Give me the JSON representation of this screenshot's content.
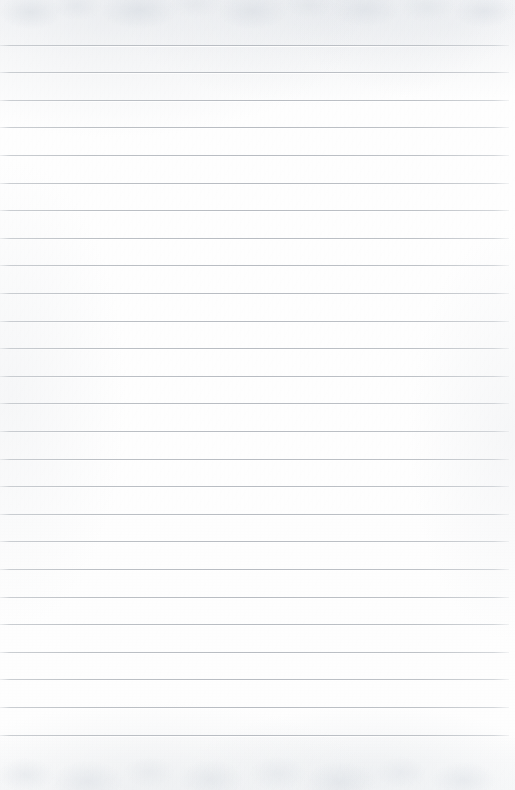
{
  "document": {
    "kind": "lined-notebook-paper-scan",
    "title": "Blank ruled paper",
    "written_content": "",
    "page_width": 515,
    "page_height": 790,
    "paper_color": "#fdfdfd",
    "rule_color": "#bcc0c5",
    "rule_count": 26,
    "first_rule_y": 44.5,
    "rule_spacing": 27.6,
    "rule_thickness": 1,
    "rule_start_x": 0,
    "rule_end_x": 509,
    "top_margin": 44,
    "bottom_margin": 55,
    "has_margin_rule": false,
    "has_holes": false,
    "has_handwriting": false
  },
  "rules": [
    {
      "index": 1,
      "y": 44.5,
      "x_start": 0,
      "x_end": 509
    },
    {
      "index": 2,
      "y": 72.1,
      "x_start": 0,
      "x_end": 509
    },
    {
      "index": 3,
      "y": 99.7,
      "x_start": 0,
      "x_end": 509
    },
    {
      "index": 4,
      "y": 127.3,
      "x_start": 0,
      "x_end": 509
    },
    {
      "index": 5,
      "y": 154.9,
      "x_start": 0,
      "x_end": 509
    },
    {
      "index": 6,
      "y": 182.5,
      "x_start": 0,
      "x_end": 509
    },
    {
      "index": 7,
      "y": 210.1,
      "x_start": 0,
      "x_end": 509
    },
    {
      "index": 8,
      "y": 237.7,
      "x_start": 0,
      "x_end": 509
    },
    {
      "index": 9,
      "y": 265.3,
      "x_start": 0,
      "x_end": 509
    },
    {
      "index": 10,
      "y": 292.9,
      "x_start": 0,
      "x_end": 509
    },
    {
      "index": 11,
      "y": 320.5,
      "x_start": 0,
      "x_end": 509
    },
    {
      "index": 12,
      "y": 348.1,
      "x_start": 0,
      "x_end": 509
    },
    {
      "index": 13,
      "y": 375.7,
      "x_start": 0,
      "x_end": 509
    },
    {
      "index": 14,
      "y": 403.3,
      "x_start": 0,
      "x_end": 509
    },
    {
      "index": 15,
      "y": 430.9,
      "x_start": 0,
      "x_end": 509
    },
    {
      "index": 16,
      "y": 458.5,
      "x_start": 0,
      "x_end": 509
    },
    {
      "index": 17,
      "y": 486.1,
      "x_start": 0,
      "x_end": 509
    },
    {
      "index": 18,
      "y": 513.7,
      "x_start": 0,
      "x_end": 509
    },
    {
      "index": 19,
      "y": 541.3,
      "x_start": 0,
      "x_end": 509
    },
    {
      "index": 20,
      "y": 568.9,
      "x_start": 0,
      "x_end": 509
    },
    {
      "index": 21,
      "y": 596.5,
      "x_start": 0,
      "x_end": 509
    },
    {
      "index": 22,
      "y": 624.1,
      "x_start": 0,
      "x_end": 509
    },
    {
      "index": 23,
      "y": 651.7,
      "x_start": 0,
      "x_end": 509
    },
    {
      "index": 24,
      "y": 679.3,
      "x_start": 0,
      "x_end": 509
    },
    {
      "index": 25,
      "y": 706.9,
      "x_start": 0,
      "x_end": 509
    },
    {
      "index": 26,
      "y": 734.5,
      "x_start": 0,
      "x_end": 509
    }
  ]
}
